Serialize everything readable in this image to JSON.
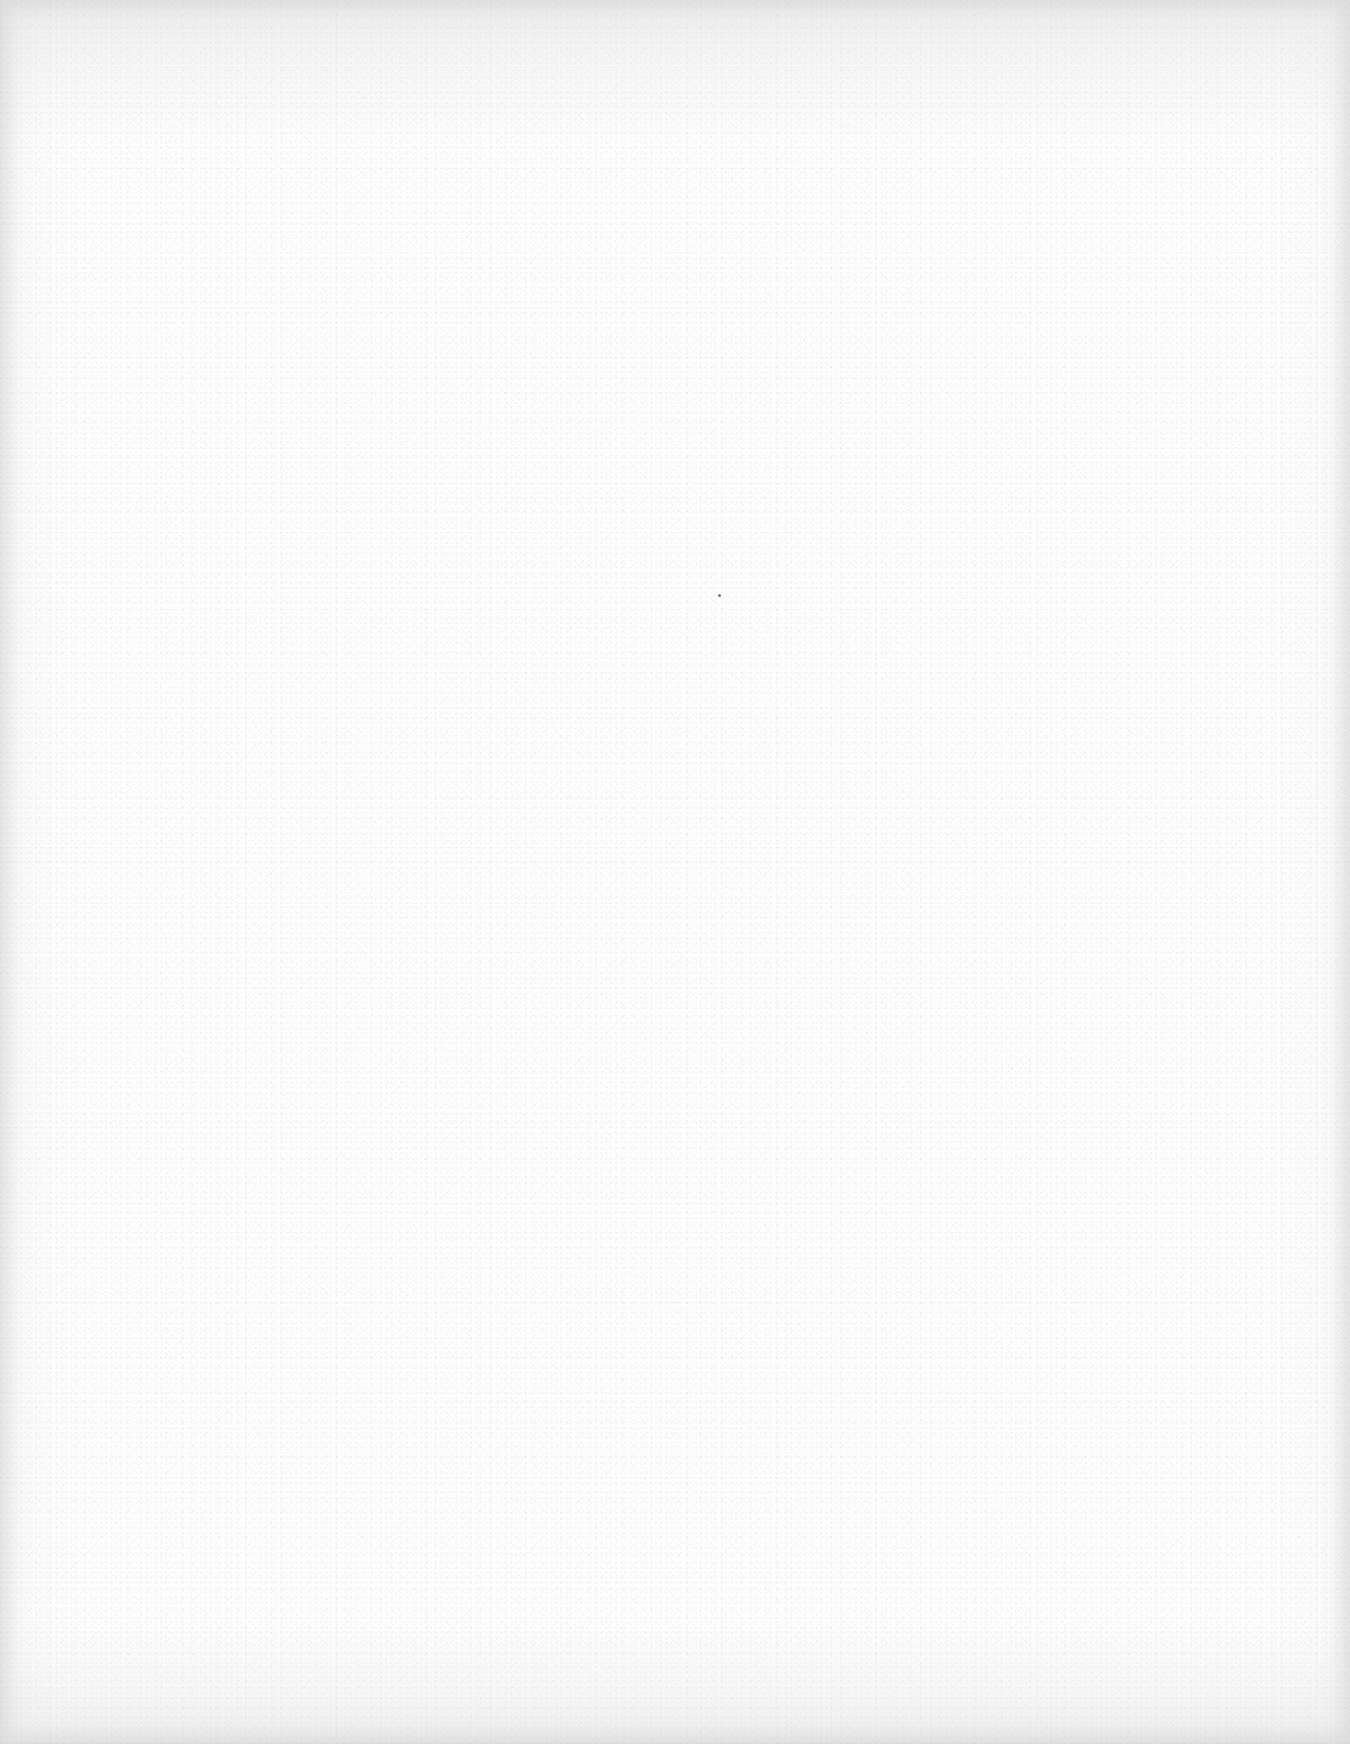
{
  "page": {
    "type": "blank-scanned-page",
    "text_content": []
  }
}
